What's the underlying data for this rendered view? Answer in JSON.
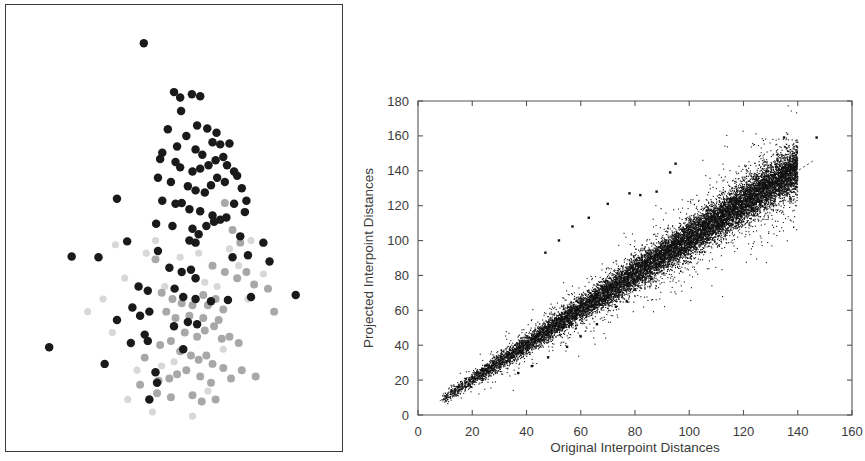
{
  "figure": {
    "background_color": "#ffffff",
    "panels": [
      "projection-scatter",
      "shepard-diagram"
    ]
  },
  "left_panel": {
    "name": "projection-scatter",
    "border_color": "#3a3a3a",
    "has_axes": false,
    "has_ticks": false,
    "has_labels": false,
    "group_colors": {
      "dark": "#1a1a1a",
      "gray": "#a8a8a8",
      "faint": "#d8d8d8"
    }
  },
  "chart_data": [
    {
      "type": "scatter",
      "name": "projection-scatter",
      "title": "",
      "xlabel": "",
      "ylabel": "",
      "xlim": [
        0,
        100
      ],
      "ylim": [
        0,
        100
      ],
      "grid": false,
      "legend": "none",
      "axes_visible": false,
      "series": [
        {
          "name": "group-dark",
          "color": "#1a1a1a",
          "marker": "filled-circle",
          "marker_size_px": 8.5,
          "points": [
            [
              40.2,
              94.2
            ],
            [
              50.0,
              82.5
            ],
            [
              52.0,
              81.2
            ],
            [
              55.8,
              82.0
            ],
            [
              58.5,
              81.5
            ],
            [
              52.3,
              78.0
            ],
            [
              48.0,
              73.6
            ],
            [
              54.0,
              72.0
            ],
            [
              57.5,
              74.5
            ],
            [
              60.8,
              73.8
            ],
            [
              63.8,
              72.8
            ],
            [
              62.5,
              70.5
            ],
            [
              65.0,
              70.0
            ],
            [
              51.0,
              69.5
            ],
            [
              57.0,
              68.8
            ],
            [
              59.2,
              67.5
            ],
            [
              46.2,
              68.0
            ],
            [
              45.5,
              66.5
            ],
            [
              50.5,
              65.8
            ],
            [
              52.0,
              64.5
            ],
            [
              56.0,
              63.5
            ],
            [
              58.5,
              64.2
            ],
            [
              61.2,
              65.0
            ],
            [
              63.5,
              66.2
            ],
            [
              66.0,
              67.0
            ],
            [
              68.0,
              70.2
            ],
            [
              67.2,
              65.0
            ],
            [
              69.5,
              63.5
            ],
            [
              44.8,
              62.0
            ],
            [
              49.0,
              61.0
            ],
            [
              54.5,
              60.0
            ],
            [
              57.0,
              59.0
            ],
            [
              60.0,
              58.5
            ],
            [
              62.0,
              60.2
            ],
            [
              64.0,
              62.0
            ],
            [
              66.5,
              61.0
            ],
            [
              70.5,
              62.5
            ],
            [
              72.0,
              59.5
            ],
            [
              73.5,
              56.5
            ],
            [
              73.0,
              53.8
            ],
            [
              31.5,
              57.0
            ],
            [
              46.2,
              56.5
            ],
            [
              50.5,
              55.8
            ],
            [
              52.5,
              56.0
            ],
            [
              55.0,
              54.5
            ],
            [
              58.5,
              54.0
            ],
            [
              62.5,
              53.0
            ],
            [
              65.0,
              52.0
            ],
            [
              44.2,
              51.0
            ],
            [
              49.5,
              50.5
            ],
            [
              56.0,
              49.8
            ],
            [
              58.0,
              48.5
            ],
            [
              60.5,
              50.5
            ],
            [
              63.0,
              51.5
            ],
            [
              67.0,
              52.5
            ],
            [
              69.5,
              55.8
            ],
            [
              55.0,
              47.0
            ],
            [
              57.0,
              46.5
            ],
            [
              71.5,
              48.0
            ],
            [
              79.0,
              46.5
            ],
            [
              34.8,
              46.8
            ],
            [
              44.8,
              44.5
            ],
            [
              16.8,
              43.2
            ],
            [
              25.5,
              43.0
            ],
            [
              69.0,
              43.0
            ],
            [
              74.0,
              43.5
            ],
            [
              81.0,
              42.0
            ],
            [
              48.5,
              40.5
            ],
            [
              52.5,
              39.5
            ],
            [
              55.5,
              40.0
            ],
            [
              57.0,
              38.0
            ],
            [
              38.5,
              36.0
            ],
            [
              41.5,
              35.0
            ],
            [
              50.2,
              35.5
            ],
            [
              53.0,
              33.5
            ],
            [
              57.0,
              33.0
            ],
            [
              62.0,
              32.5
            ],
            [
              67.5,
              32.8
            ],
            [
              75.0,
              33.5
            ],
            [
              89.5,
              34.0
            ],
            [
              36.5,
              31.0
            ],
            [
              39.0,
              29.0
            ],
            [
              42.0,
              30.0
            ],
            [
              31.5,
              28.0
            ],
            [
              50.0,
              26.5
            ],
            [
              54.5,
              27.5
            ],
            [
              57.5,
              27.0
            ],
            [
              40.5,
              24.5
            ],
            [
              41.5,
              23.0
            ],
            [
              36.0,
              22.5
            ],
            [
              53.0,
              21.0
            ],
            [
              9.5,
              21.5
            ],
            [
              27.5,
              17.5
            ],
            [
              44.0,
              15.5
            ],
            [
              44.5,
              13.0
            ],
            [
              42.0,
              9.0
            ]
          ]
        },
        {
          "name": "group-gray",
          "color": "#a8a8a8",
          "marker": "filled-circle",
          "marker_size_px": 8.0,
          "points": [
            [
              66.5,
              56.0
            ],
            [
              69.0,
              49.5
            ],
            [
              71.5,
              46.5
            ],
            [
              44.0,
              42.5
            ],
            [
              62.5,
              41.0
            ],
            [
              66.5,
              39.5
            ],
            [
              70.5,
              38.0
            ],
            [
              73.5,
              39.5
            ],
            [
              76.0,
              36.5
            ],
            [
              80.5,
              35.5
            ],
            [
              46.0,
              34.5
            ],
            [
              49.5,
              33.0
            ],
            [
              52.5,
              32.0
            ],
            [
              56.0,
              31.5
            ],
            [
              59.5,
              34.0
            ],
            [
              61.0,
              31.5
            ],
            [
              63.5,
              33.0
            ],
            [
              66.0,
              30.5
            ],
            [
              64.5,
              28.0
            ],
            [
              59.5,
              28.5
            ],
            [
              55.0,
              29.0
            ],
            [
              50.5,
              28.5
            ],
            [
              47.5,
              30.0
            ],
            [
              82.5,
              30.0
            ],
            [
              53.5,
              25.0
            ],
            [
              57.5,
              24.0
            ],
            [
              60.0,
              25.5
            ],
            [
              63.0,
              26.5
            ],
            [
              65.5,
              23.5
            ],
            [
              68.0,
              24.0
            ],
            [
              71.0,
              22.5
            ],
            [
              49.0,
              23.0
            ],
            [
              45.5,
              22.0
            ],
            [
              52.0,
              20.5
            ],
            [
              55.5,
              19.5
            ],
            [
              58.0,
              18.5
            ],
            [
              60.5,
              19.5
            ],
            [
              62.5,
              17.5
            ],
            [
              66.0,
              16.5
            ],
            [
              54.0,
              16.0
            ],
            [
              51.0,
              15.0
            ],
            [
              48.5,
              14.0
            ],
            [
              45.0,
              13.5
            ],
            [
              58.5,
              14.5
            ],
            [
              62.0,
              13.0
            ],
            [
              68.5,
              14.0
            ],
            [
              72.0,
              16.0
            ],
            [
              76.5,
              14.5
            ],
            [
              44.5,
              10.5
            ],
            [
              49.0,
              9.5
            ],
            [
              56.0,
              10.0
            ],
            [
              59.0,
              8.5
            ],
            [
              63.5,
              9.0
            ],
            [
              40.5,
              19.0
            ],
            [
              39.0,
              12.5
            ]
          ]
        }
      ]
    },
    {
      "type": "scatter",
      "name": "shepard-diagram",
      "title": "",
      "xlabel": "Original Interpoint Distances",
      "ylabel": "Projected Interpoint Distances",
      "xlim": [
        0,
        160
      ],
      "ylim": [
        0,
        180
      ],
      "xticks": [
        0,
        20,
        40,
        60,
        80,
        100,
        120,
        140,
        160
      ],
      "yticks": [
        0,
        20,
        40,
        60,
        80,
        100,
        120,
        140,
        160,
        180
      ],
      "grid": false,
      "legend": "none",
      "point_color": "#111111",
      "point_size_px": 1.1,
      "n_points_approx": 14000,
      "band": {
        "x_start": 8,
        "x_end": 140,
        "slope": 1.0,
        "intercept": 0.0,
        "spread_min": 2.5,
        "spread_max": 11.0,
        "description": "dense elongated cloud along y = x, widening with x"
      },
      "reference_line": {
        "name": "identity-line",
        "style": "dotted",
        "from": [
          8,
          8
        ],
        "to": [
          146,
          146
        ],
        "color": "#555555"
      },
      "outliers": [
        [
          95,
          144
        ],
        [
          93,
          139
        ],
        [
          135,
          159
        ],
        [
          147,
          159
        ],
        [
          78,
          127
        ],
        [
          82,
          126
        ],
        [
          88,
          128
        ],
        [
          70,
          121
        ],
        [
          63,
          113
        ],
        [
          57,
          108
        ],
        [
          52,
          100
        ],
        [
          47,
          93
        ],
        [
          99,
          99
        ],
        [
          92,
          85
        ],
        [
          86,
          78
        ],
        [
          80,
          72
        ],
        [
          77,
          65
        ],
        [
          73,
          62
        ],
        [
          66,
          52
        ],
        [
          60,
          45
        ],
        [
          55,
          39
        ],
        [
          48,
          33
        ],
        [
          42,
          28
        ],
        [
          37,
          24
        ]
      ]
    }
  ],
  "axes": {
    "x": {
      "title": "Original Interpoint Distances",
      "tick_labels": [
        "0",
        "20",
        "40",
        "60",
        "80",
        "100",
        "120",
        "140",
        "160"
      ]
    },
    "y": {
      "title": "Projected Interpoint Distances",
      "tick_labels": [
        "0",
        "20",
        "40",
        "60",
        "80",
        "100",
        "120",
        "140",
        "160",
        "180"
      ]
    }
  }
}
